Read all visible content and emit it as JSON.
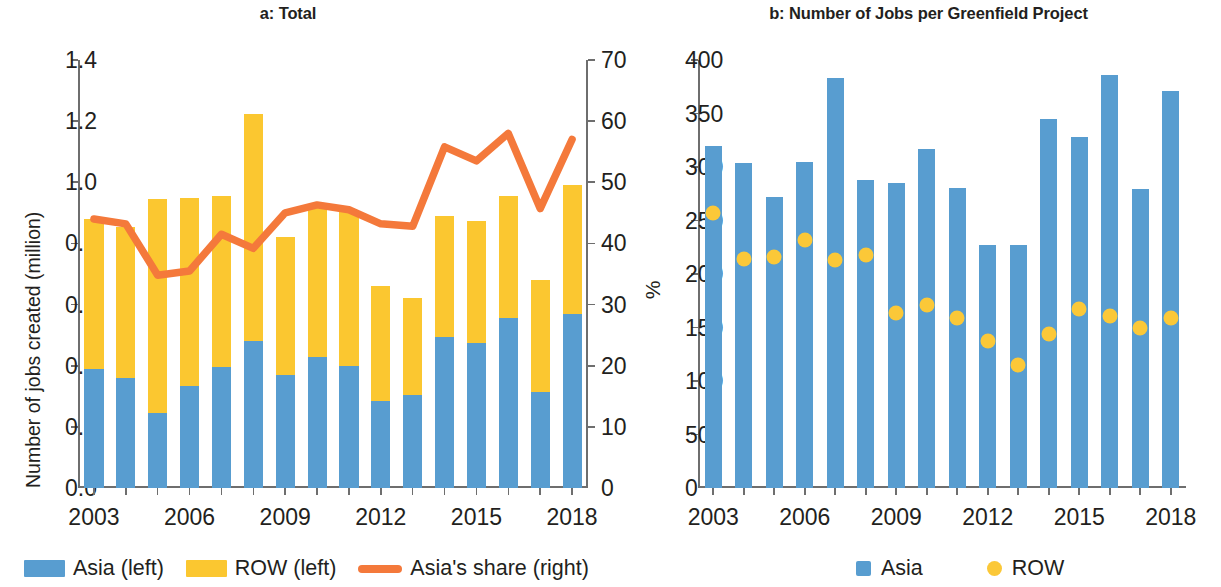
{
  "figure": {
    "panel_a": {
      "title": "a: Total",
      "ylabel_left": "Number of jobs created (million)",
      "ylabel_right": "%",
      "legend": [
        {
          "label": "Asia (left)",
          "marker": "square-swatch-icon",
          "color": "#589dd0"
        },
        {
          "label": "ROW (left)",
          "marker": "square-swatch-icon",
          "color": "#fbc730"
        },
        {
          "label": "Asia's share (right)",
          "marker": "line-swatch-icon",
          "color": "#f4793b"
        }
      ]
    },
    "panel_b": {
      "title": "b: Number of Jobs per Greenfield Project",
      "legend": [
        {
          "label": "Asia",
          "marker": "square-swatch-icon",
          "color": "#589dd0"
        },
        {
          "label": "ROW",
          "marker": "dot-swatch-icon",
          "color": "#fbc838"
        }
      ]
    }
  },
  "chart_data": [
    {
      "id": "panel-a",
      "type": "bar",
      "title": "a: Total",
      "xlabel": "",
      "ylabel": "Number of jobs created (million)",
      "ylabel_secondary": "%",
      "ylim": [
        0.0,
        1.4
      ],
      "ylim_secondary": [
        0,
        70
      ],
      "yticks": [
        "0.0",
        "0.2",
        "0.4",
        "0.6",
        "0.8",
        "1.0",
        "1.2",
        "1.4"
      ],
      "ytick_values": [
        0.0,
        0.2,
        0.4,
        0.6,
        0.8,
        1.0,
        1.2,
        1.4
      ],
      "yticks_secondary": [
        "0",
        "10",
        "20",
        "30",
        "40",
        "50",
        "60",
        "70"
      ],
      "ytick_values_secondary": [
        0,
        10,
        20,
        30,
        40,
        50,
        60,
        70
      ],
      "grid": false,
      "legend_position": "bottom-left",
      "stacked": true,
      "categories": [
        2003,
        2004,
        2005,
        2006,
        2007,
        2008,
        2009,
        2010,
        2011,
        2012,
        2013,
        2014,
        2015,
        2016,
        2017,
        2018
      ],
      "xtick_labels": [
        "2003",
        "2006",
        "2009",
        "2012",
        "2015",
        "2018"
      ],
      "xtick_categories": [
        2003,
        2006,
        2009,
        2012,
        2015,
        2018
      ],
      "series": [
        {
          "name": "Asia (left)",
          "axis": "left",
          "color": "#589dd0",
          "values": [
            0.39,
            0.36,
            0.245,
            0.335,
            0.395,
            0.48,
            0.37,
            0.43,
            0.4,
            0.285,
            0.305,
            0.495,
            0.475,
            0.555,
            0.315,
            0.57
          ]
        },
        {
          "name": "ROW (left)",
          "axis": "left",
          "color": "#fbc730",
          "values": [
            0.49,
            0.495,
            0.7,
            0.615,
            0.56,
            0.745,
            0.45,
            0.485,
            0.51,
            0.375,
            0.315,
            0.395,
            0.4,
            0.4,
            0.365,
            0.42
          ]
        },
        {
          "name": "Total (left)",
          "axis": "left",
          "derived": "stack total",
          "values": [
            0.88,
            0.855,
            0.945,
            0.95,
            0.955,
            1.225,
            0.82,
            0.915,
            0.91,
            0.66,
            0.62,
            0.89,
            0.875,
            0.955,
            0.68,
            0.99
          ]
        },
        {
          "name": "Asia's share (right)",
          "axis": "right",
          "type": "line",
          "color": "#f4793b",
          "values": [
            44.0,
            43.2,
            34.8,
            35.5,
            41.5,
            39.2,
            45.0,
            46.3,
            45.5,
            43.2,
            42.8,
            55.8,
            53.5,
            58.0,
            45.7,
            57.0
          ]
        }
      ]
    },
    {
      "id": "panel-b",
      "type": "bar",
      "title": "b: Number of Jobs per Greenfield Project",
      "xlabel": "",
      "ylabel": "",
      "ylim": [
        0,
        400
      ],
      "yticks": [
        "0",
        "50",
        "100",
        "150",
        "200",
        "250",
        "300",
        "350",
        "400"
      ],
      "ytick_values": [
        0,
        50,
        100,
        150,
        200,
        250,
        300,
        350,
        400
      ],
      "grid": false,
      "legend_position": "bottom-center",
      "categories": [
        2003,
        2004,
        2005,
        2006,
        2007,
        2008,
        2009,
        2010,
        2011,
        2012,
        2013,
        2014,
        2015,
        2016,
        2017,
        2018
      ],
      "xtick_labels": [
        "2003",
        "2006",
        "2009",
        "2012",
        "2015",
        "2018"
      ],
      "xtick_categories": [
        2003,
        2006,
        2009,
        2012,
        2015,
        2018
      ],
      "series": [
        {
          "name": "Asia",
          "type": "bar",
          "color": "#589dd0",
          "values": [
            320,
            304,
            272,
            305,
            383,
            288,
            285,
            317,
            280,
            227,
            227,
            345,
            328,
            386,
            279,
            371
          ]
        },
        {
          "name": "ROW",
          "type": "scatter",
          "color": "#fbc838",
          "values": [
            257,
            214,
            216,
            232,
            213,
            218,
            164,
            171,
            159,
            137,
            115,
            144,
            167,
            161,
            150,
            159
          ]
        }
      ]
    }
  ]
}
